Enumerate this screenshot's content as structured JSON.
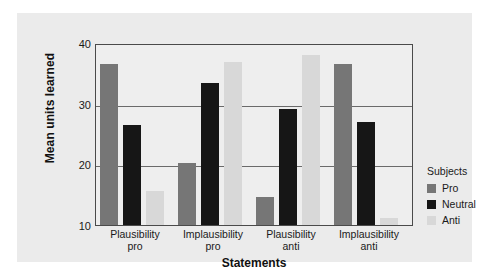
{
  "chart_data": {
    "type": "bar",
    "title": "",
    "xlabel": "Statements",
    "ylabel": "Mean units learned",
    "ylim": [
      10,
      40
    ],
    "yticks": [
      10,
      20,
      30,
      40
    ],
    "grid": true,
    "legend_position": "right",
    "legend_title": "Subjects",
    "categories": [
      {
        "line1": "Plausibility",
        "line2": "pro"
      },
      {
        "line1": "Implausibility",
        "line2": "pro"
      },
      {
        "line1": "Plausibility",
        "line2": "anti"
      },
      {
        "line1": "Implausibility",
        "line2": "anti"
      }
    ],
    "category_labels": [
      "Plausibility pro",
      "Implausibility pro",
      "Plausibility anti",
      "Implausibility anti"
    ],
    "series": [
      {
        "name": "Pro",
        "color": "#767676",
        "values": [
          36.8,
          20.3,
          14.6,
          36.8
        ]
      },
      {
        "name": "Neutral",
        "color": "#161616",
        "values": [
          26.6,
          33.6,
          29.3,
          27.2
        ]
      },
      {
        "name": "Anti",
        "color": "#d8d8d8",
        "values": [
          15.7,
          37.1,
          38.4,
          11.2
        ]
      }
    ]
  },
  "axis": {
    "ytick_labels": [
      "40",
      "30",
      "20",
      "10"
    ],
    "ylabel": "Mean units learned",
    "xlabel": "Statements"
  },
  "legend": {
    "title": "Subjects",
    "items": [
      {
        "label": "Pro",
        "color": "#767676"
      },
      {
        "label": "Neutral",
        "color": "#161616"
      },
      {
        "label": "Anti",
        "color": "#d8d8d8"
      }
    ]
  }
}
